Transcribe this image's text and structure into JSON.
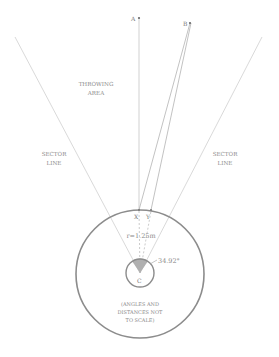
{
  "diagram": {
    "labels": {
      "throwing_area_line1": "THROWING",
      "throwing_area_line2": "AREA",
      "sector_left_line1": "SECTOR",
      "sector_left_line2": "LINE",
      "sector_right_line1": "SECTOR",
      "sector_right_line2": "LINE",
      "radius": "r=1.25m",
      "angle": "34.92°",
      "note_line1": "(ANGLES AND",
      "note_line2": "DISTANCES NOT",
      "note_line3": "TO SCALE)"
    },
    "points": {
      "A": "A",
      "B": "B",
      "X": "X",
      "Y": "Y",
      "C": "C"
    },
    "colors": {
      "line": "#c8c8c8",
      "circle": "#8c8c8c",
      "text": "#8a8a8a",
      "wedge": "#b0b0b0"
    }
  }
}
